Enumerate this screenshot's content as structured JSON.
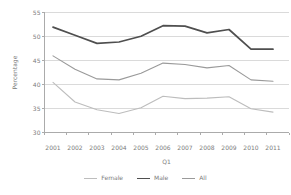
{
  "chart_data": {
    "type": "line",
    "title": "",
    "xlabel": "Q1",
    "ylabel": "Percentage",
    "ylim": [
      30,
      55
    ],
    "yticks": [
      30,
      35,
      40,
      45,
      50,
      55
    ],
    "categories": [
      "2001",
      "2002",
      "2003",
      "2004",
      "2005",
      "2006",
      "2007",
      "2008",
      "2009",
      "2010",
      "2011"
    ],
    "grid": true,
    "legend_position": "bottom",
    "series": [
      {
        "name": "Female",
        "color": "#bdbdbd",
        "stroke_width": 1.1,
        "values": [
          40.5,
          36.4,
          34.8,
          34.0,
          35.2,
          37.6,
          37.1,
          37.2,
          37.5,
          35.0,
          34.3
        ]
      },
      {
        "name": "Male",
        "color": "#4f4f4f",
        "stroke_width": 1.7,
        "values": [
          52.0,
          50.3,
          48.6,
          48.9,
          50.1,
          52.3,
          52.2,
          50.8,
          51.5,
          47.4,
          47.4
        ]
      },
      {
        "name": "All",
        "color": "#9a9a9a",
        "stroke_width": 1.1,
        "values": [
          46.0,
          43.2,
          41.2,
          41.0,
          42.4,
          44.5,
          44.2,
          43.5,
          44.0,
          41.0,
          40.7
        ]
      }
    ],
    "colors": {
      "gridline": "#dadada",
      "axis": "#ababab",
      "text": "#7c7c7c",
      "background": "#ffffff"
    }
  }
}
